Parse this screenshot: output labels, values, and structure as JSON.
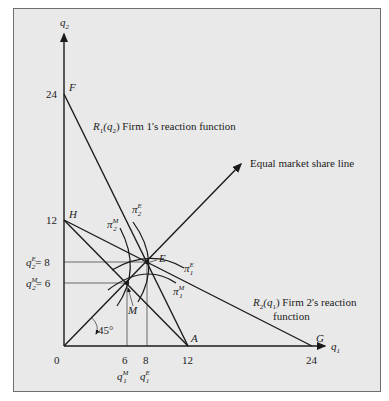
{
  "diagram": {
    "type": "cournot_vs_collusion_reaction_functions",
    "axes": {
      "x_label": "q",
      "x_sub": "1",
      "y_label": "q",
      "y_sub": "2",
      "origin_label": "0",
      "x_ticks": [
        "6",
        "8",
        "12",
        "24"
      ],
      "y_ticks": [
        "24",
        "12"
      ],
      "y_marked": [
        {
          "lhs": "q",
          "sub": "2",
          "sup": "E",
          "rhs": "= 8"
        },
        {
          "lhs": "q",
          "sub": "2",
          "sup": "M",
          "rhs": "= 6"
        }
      ],
      "x_marked": [
        {
          "lhs": "q",
          "sub": "1",
          "sup": "M"
        },
        {
          "lhs": "q",
          "sub": "1",
          "sup": "E"
        }
      ]
    },
    "points": {
      "F": "F",
      "H": "H",
      "E": "E",
      "M": "M",
      "A": "A",
      "G": "G"
    },
    "labels": {
      "r1": "R",
      "r1_sub": "1",
      "r1_arg": "(q",
      "r1_arg_sub": "2",
      "r1_tail": ") Firm 1's reaction function",
      "r2": "R",
      "r2_sub": "2",
      "r2_arg": "(q",
      "r2_arg_sub": "1",
      "r2_tail": ") Firm 2's reaction",
      "r2_line2": "function",
      "equal_share": "Equal market share line",
      "angle": "45°"
    },
    "isoprofits": [
      {
        "sym": "π",
        "sub": "2",
        "sup": "M"
      },
      {
        "sym": "π",
        "sub": "2",
        "sup": "E"
      },
      {
        "sym": "π",
        "sub": "1",
        "sup": "E"
      },
      {
        "sym": "π",
        "sub": "1",
        "sup": "M"
      }
    ],
    "data": {
      "R1": {
        "q2_intercept": 24,
        "q1_intercept": 12
      },
      "R2": {
        "q2_intercept": 12,
        "q1_intercept": 24
      },
      "cournot_equilibrium": {
        "q1": 8,
        "q2": 8
      },
      "collusive_outcome": {
        "q1": 6,
        "q2": 6
      }
    }
  }
}
